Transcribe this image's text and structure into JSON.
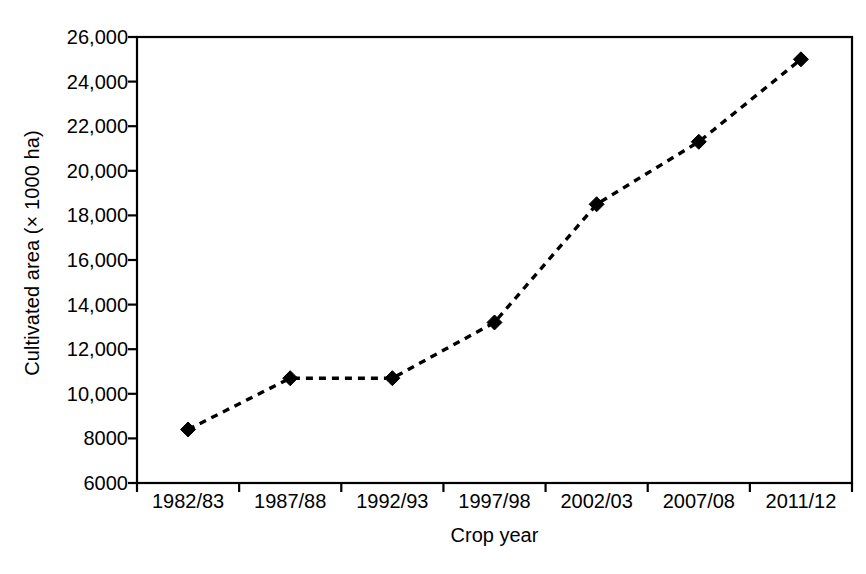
{
  "chart_data": {
    "type": "line",
    "title": "",
    "xlabel": "Crop year",
    "ylabel": "Cultivated area (× 1000 ha)",
    "categories": [
      "1982/83",
      "1987/88",
      "1992/93",
      "1997/98",
      "2002/03",
      "2007/08",
      "2011/12"
    ],
    "values": [
      8400,
      10700,
      10700,
      13200,
      18500,
      21300,
      25000
    ],
    "ylim": [
      6000,
      26000
    ],
    "ytick_values": [
      6000,
      8000,
      10000,
      12000,
      14000,
      16000,
      18000,
      20000,
      22000,
      24000,
      26000
    ],
    "ytick_labels": [
      "6000",
      "8000",
      "10,000",
      "12,000",
      "14,000",
      "16,000",
      "18,000",
      "20,000",
      "22,000",
      "24,000",
      "26,000"
    ],
    "grid": false,
    "legend": null,
    "series": [
      {
        "name": "Cultivated area",
        "values": [
          8400,
          10700,
          10700,
          13200,
          18500,
          21300,
          25000
        ],
        "line_style": "dashed",
        "line_color": "#000000",
        "marker": "diamond",
        "marker_color": "#000000"
      }
    ],
    "annotations": []
  },
  "axes": {
    "frame_color": "#000000",
    "tick_color": "#000000"
  }
}
